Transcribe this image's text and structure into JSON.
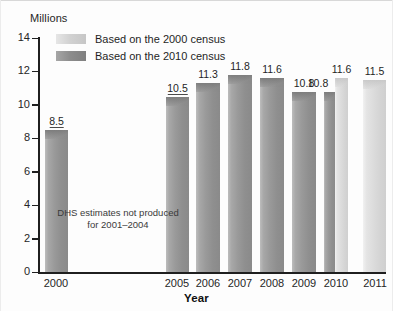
{
  "chart_data": {
    "type": "bar",
    "title": "",
    "ylabel": "Millions",
    "xlabel": "Year",
    "ylim": [
      0,
      14
    ],
    "ytick_labels": [
      "14",
      "12",
      "10",
      "8",
      "6",
      "4",
      "2",
      "0"
    ],
    "ytick_values": [
      14,
      12,
      10,
      8,
      6,
      4,
      2,
      0
    ],
    "grid": false,
    "legend_position": "top-left",
    "categories": [
      "2000",
      "2005",
      "2006",
      "2007",
      "2008",
      "2009",
      "2010",
      "2011"
    ],
    "series": [
      {
        "name": "Based on the 2010 census",
        "color": "#8f8f8f",
        "values": [
          8.5,
          10.5,
          11.3,
          11.8,
          11.6,
          10.8,
          null,
          null
        ]
      },
      {
        "name": "Based on the 2000 census",
        "color": "#d8d8d8",
        "values": [
          null,
          null,
          null,
          null,
          null,
          null,
          11.6,
          11.5
        ]
      }
    ],
    "bars": [
      {
        "category": "2000",
        "value": 8.5,
        "label": "8.5",
        "series": "Based on the 2010 census",
        "shade": "dark",
        "underlined": true
      },
      {
        "category": "2005",
        "value": 10.5,
        "label": "10.5",
        "series": "Based on the 2010 census",
        "shade": "dark",
        "underlined": true
      },
      {
        "category": "2006",
        "value": 11.3,
        "label": "11.3",
        "series": "Based on the 2010 census",
        "shade": "dark",
        "underlined": false
      },
      {
        "category": "2007",
        "value": 11.8,
        "label": "11.8",
        "series": "Based on the 2010 census",
        "shade": "dark",
        "underlined": false
      },
      {
        "category": "2008",
        "value": 11.6,
        "label": "11.6",
        "series": "Based on the 2010 census",
        "shade": "dark",
        "underlined": false
      },
      {
        "category": "2009",
        "value": 10.8,
        "label": "10.8",
        "series": "Based on the 2010 census",
        "shade": "dark",
        "underlined": false
      },
      {
        "category": "2010",
        "value": 10.8,
        "label": "10.8",
        "series": "Based on the 2010 census",
        "shade": "dark",
        "underlined": false
      },
      {
        "category": "2010b",
        "value": 11.6,
        "label": "11.6",
        "series": "Based on the 2000 census",
        "shade": "light",
        "underlined": false
      },
      {
        "category": "2011",
        "value": 11.5,
        "label": "11.5",
        "series": "Based on the 2000 census",
        "shade": "light",
        "underlined": false
      }
    ],
    "annotations": [
      {
        "text": "DHS estimates not produced for 2001–2004"
      }
    ]
  },
  "legend": {
    "items": [
      {
        "label": "Based on the 2000 census",
        "shade": "light",
        "color": "#d8d8d8"
      },
      {
        "label": "Based on the 2010 census",
        "shade": "dark",
        "color": "#8f8f8f"
      }
    ]
  },
  "annotation": {
    "line1": "DHS estimates not produced",
    "line2": "for 2001–2004"
  }
}
